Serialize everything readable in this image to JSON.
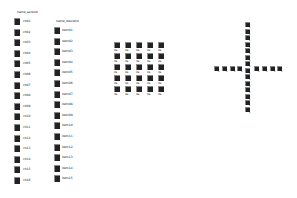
{
  "column_left": {
    "header": "name_ascend",
    "items": [
      {
        "label": "ch01"
      },
      {
        "label": "ch02"
      },
      {
        "label": "ch03"
      },
      {
        "label": "ch04"
      },
      {
        "label": "ch05"
      },
      {
        "label": "ch06"
      },
      {
        "label": "ch07"
      },
      {
        "label": "ch08"
      },
      {
        "label": "ch09"
      },
      {
        "label": "ch10"
      },
      {
        "label": "ch11"
      },
      {
        "label": "ch12"
      },
      {
        "label": "ch13"
      },
      {
        "label": "ch14"
      },
      {
        "label": "ch15"
      },
      {
        "label": "ch16"
      }
    ]
  },
  "column_right": {
    "header": "name_descend",
    "items": [
      {
        "label": "item01"
      },
      {
        "label": "item02"
      },
      {
        "label": "item03"
      },
      {
        "label": "item04"
      },
      {
        "label": "item05"
      },
      {
        "label": "item06"
      },
      {
        "label": "item07"
      },
      {
        "label": "item08"
      },
      {
        "label": "item09"
      },
      {
        "label": "item10"
      },
      {
        "label": "item11"
      },
      {
        "label": "item12"
      },
      {
        "label": "item13"
      },
      {
        "label": "item14"
      },
      {
        "label": "item15"
      }
    ]
  },
  "grid": {
    "rows": 5,
    "cols": 5,
    "label": "file"
  },
  "cross": {
    "vertical_count": 14,
    "horizontal_count": 8,
    "label": "x"
  }
}
